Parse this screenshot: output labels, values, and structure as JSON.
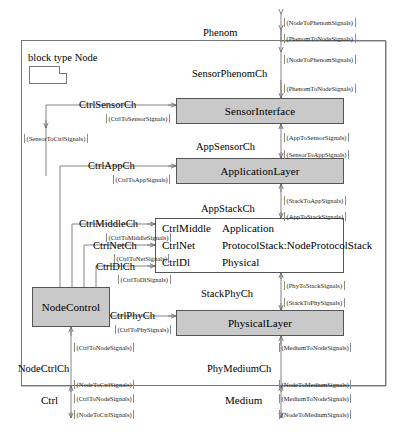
{
  "diagram": {
    "kind": "sysml-internal-block-diagram",
    "block_title": "block type Node",
    "note_icon": "diagram-note-icon",
    "colors": {
      "component_fill": "#c9c9c9",
      "component_stroke": "#555555",
      "frame_stroke": "#777777",
      "wire_stroke": "#666666",
      "background": "#ffffff",
      "text": "#000000"
    }
  },
  "components": [
    {
      "id": "sensor-interface",
      "label": "SensorInterface",
      "x": 176,
      "y": 98,
      "w": 168,
      "h": 26
    },
    {
      "id": "application-layer",
      "label": "ApplicationLayer",
      "x": 176,
      "y": 158,
      "w": 168,
      "h": 26
    },
    {
      "id": "physical-layer",
      "label": "PhysicalLayer",
      "x": 176,
      "y": 310,
      "w": 168,
      "h": 26
    },
    {
      "id": "node-control",
      "label": "NodeControl",
      "x": 32,
      "y": 287,
      "w": 78,
      "h": 40
    }
  ],
  "protocol_stack": {
    "id": "node-protocol-stack",
    "x": 155,
    "y": 218,
    "w": 189,
    "h": 55,
    "rows": [
      {
        "port": "CtrlMiddle",
        "name": "Application"
      },
      {
        "port": "CtrlNet",
        "name": "ProtocolStack:NodeProtocolStack"
      },
      {
        "port": "CtrlDl",
        "name": "Physical"
      }
    ]
  },
  "channels": [
    {
      "id": "phenom",
      "label": "Phenom",
      "x": 203,
      "y": 27,
      "anchor": "right"
    },
    {
      "id": "sensor-phenom",
      "label": "SensorPhenomCh",
      "x": 192,
      "y": 68,
      "anchor": "right"
    },
    {
      "id": "ctrl-sensor",
      "label": "CtrlSensorCh",
      "x": 79,
      "y": 99,
      "anchor": "left"
    },
    {
      "id": "app-sensor",
      "label": "AppSensorCh",
      "x": 196,
      "y": 141,
      "anchor": "right"
    },
    {
      "id": "ctrl-app",
      "label": "CtrlAppCh",
      "x": 88,
      "y": 160,
      "anchor": "left"
    },
    {
      "id": "app-stack",
      "label": "AppStackCh",
      "x": 201,
      "y": 203,
      "anchor": "right"
    },
    {
      "id": "ctrl-middle",
      "label": "CtrlMiddleCh",
      "x": 79,
      "y": 218,
      "anchor": "left"
    },
    {
      "id": "ctrl-net",
      "label": "CtrlNetCh",
      "x": 93,
      "y": 240,
      "anchor": "left"
    },
    {
      "id": "ctrl-dl",
      "label": "CtrlDlCh",
      "x": 96,
      "y": 261,
      "anchor": "left"
    },
    {
      "id": "stack-phy",
      "label": "StackPhyCh",
      "x": 201,
      "y": 288,
      "anchor": "right"
    },
    {
      "id": "ctrl-phy",
      "label": "CtrlPhyCh",
      "x": 110,
      "y": 310,
      "anchor": "left"
    },
    {
      "id": "node-ctrl",
      "label": "NodeCtrlCh",
      "x": 18,
      "y": 363,
      "anchor": "left"
    },
    {
      "id": "phy-medium",
      "label": "PhyMediumCh",
      "x": 207,
      "y": 363,
      "anchor": "right"
    }
  ],
  "external_ports": [
    {
      "id": "ctrl-port",
      "label": "Ctrl",
      "x": 80,
      "y": 400
    },
    {
      "id": "medium-port",
      "label": "Medium",
      "x": 248,
      "y": 400
    }
  ],
  "signals": [
    {
      "id": "s01",
      "text": "(NodeToPhenomSignals)",
      "x": 284,
      "y": 18
    },
    {
      "id": "s02",
      "text": "(PhenomToNodeSignals)",
      "x": 284,
      "y": 34
    },
    {
      "id": "s03",
      "text": "(NodeToPhenomSignals)",
      "x": 284,
      "y": 55
    },
    {
      "id": "s04",
      "text": "(PhenomToNodeSignals)",
      "x": 284,
      "y": 84
    },
    {
      "id": "s05",
      "text": "(CtrlToSensorSignals)",
      "x": 106,
      "y": 114
    },
    {
      "id": "s06",
      "text": "(SensorToCtrlSignals)",
      "x": 24,
      "y": 134
    },
    {
      "id": "s07",
      "text": "(AppToSensorSignals)",
      "x": 284,
      "y": 133
    },
    {
      "id": "s08",
      "text": "(SensorToAppSignals)",
      "x": 284,
      "y": 150
    },
    {
      "id": "s09",
      "text": "(CtrlToAppSignals)",
      "x": 113,
      "y": 175
    },
    {
      "id": "s10",
      "text": "(StackToAppSignals)",
      "x": 284,
      "y": 196
    },
    {
      "id": "s11",
      "text": "(AppToStackSignals)",
      "x": 284,
      "y": 212
    },
    {
      "id": "s12",
      "text": "(CtrlToMiddleSignals)",
      "x": 106,
      "y": 233
    },
    {
      "id": "s13",
      "text": "(CtrlToNetSignals)",
      "x": 114,
      "y": 254
    },
    {
      "id": "s14",
      "text": "(CtrlToDlSignals)",
      "x": 118,
      "y": 275
    },
    {
      "id": "s15",
      "text": "(PhyToStackSignals)",
      "x": 284,
      "y": 281
    },
    {
      "id": "s16",
      "text": "(StackToPhySignals)",
      "x": 284,
      "y": 298
    },
    {
      "id": "s17",
      "text": "(CtrlToPhySignals)",
      "x": 115,
      "y": 325
    },
    {
      "id": "s18",
      "text": "(CtrlToNodeSignals)",
      "x": 74,
      "y": 343
    },
    {
      "id": "s19",
      "text": "(MediumToNodeSignals)",
      "x": 279,
      "y": 343
    },
    {
      "id": "s20",
      "text": "(NodeToCtrlSignals)",
      "x": 74,
      "y": 380
    },
    {
      "id": "s21",
      "text": "(NodeToMediumSignals)",
      "x": 279,
      "y": 380
    },
    {
      "id": "s22",
      "text": "(CtrlToNodeSignals)",
      "x": 74,
      "y": 394
    },
    {
      "id": "s23",
      "text": "(MediumToNodeSignals)",
      "x": 279,
      "y": 394
    },
    {
      "id": "s24",
      "text": "(NodeToCtrlSignals)",
      "x": 74,
      "y": 410
    },
    {
      "id": "s25",
      "text": "(NodeToMediumSignals)",
      "x": 279,
      "y": 410
    }
  ]
}
